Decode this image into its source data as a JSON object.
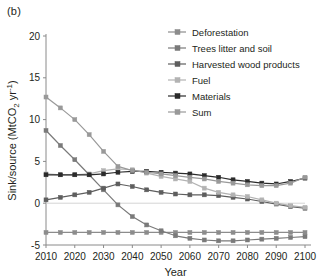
{
  "panel_label": "(b)",
  "axes": {
    "xlabel": "Year",
    "ylabel": "Sink/source (MtCO2 yr-1)",
    "ylabel_main": "Sink/source (MtCO",
    "ylabel_sub": "2",
    "ylabel_tail": " yr",
    "ylabel_sup": "-1",
    "ylabel_close": ")",
    "x_ticks": [
      "2010",
      "2020",
      "2030",
      "2040",
      "2050",
      "2060",
      "2070",
      "2080",
      "2090",
      "2100"
    ],
    "y_ticks": [
      "-5",
      "0",
      "5",
      "10",
      "15",
      "20"
    ]
  },
  "legend": {
    "position": "top-right",
    "items": [
      {
        "label": "Deforestation",
        "color": "#8c8c8c"
      },
      {
        "label": "Trees litter and soil",
        "color": "#7a7a7a"
      },
      {
        "label": "Harvested wood products",
        "color": "#5e5e5e"
      },
      {
        "label": "Fuel",
        "color": "#b3b3b3"
      },
      {
        "label": "Materials",
        "color": "#2b2b2b"
      },
      {
        "label": "Sum",
        "color": "#999999"
      }
    ]
  },
  "chart_data": {
    "type": "line",
    "title": "",
    "xlabel": "Year",
    "ylabel": "Sink/source (MtCO2 yr-1)",
    "x": [
      2010,
      2015,
      2020,
      2025,
      2030,
      2035,
      2040,
      2045,
      2050,
      2055,
      2060,
      2065,
      2070,
      2075,
      2080,
      2085,
      2090,
      2095,
      2100
    ],
    "xlim": [
      2010,
      2100
    ],
    "ylim": [
      -5,
      20
    ],
    "grid": false,
    "legend_position": "top-right",
    "series": [
      {
        "name": "Deforestation",
        "color": "#8c8c8c",
        "values": [
          -3.5,
          -3.5,
          -3.5,
          -3.5,
          -3.5,
          -3.5,
          -3.5,
          -3.5,
          -3.5,
          -3.5,
          -3.5,
          -3.5,
          -3.5,
          -3.5,
          -3.5,
          -3.5,
          -3.5,
          -3.5,
          -3.5
        ]
      },
      {
        "name": "Trees litter and soil",
        "color": "#7a7a7a",
        "values": [
          8.7,
          6.9,
          5.2,
          3.4,
          1.6,
          -0.2,
          -1.6,
          -2.6,
          -3.3,
          -3.9,
          -4.2,
          -4.4,
          -4.5,
          -4.5,
          -4.4,
          -4.3,
          -4.2,
          -4.1,
          -4.0
        ]
      },
      {
        "name": "Harvested wood products",
        "color": "#5e5e5e",
        "values": [
          0.4,
          0.7,
          1.0,
          1.3,
          1.8,
          2.3,
          2.0,
          1.6,
          1.3,
          1.1,
          1.0,
          1.0,
          0.9,
          0.7,
          0.5,
          0.2,
          -0.1,
          -0.4,
          -0.6
        ]
      },
      {
        "name": "Fuel",
        "color": "#b3b3b3",
        "values": [
          3.5,
          3.4,
          3.4,
          3.5,
          3.9,
          4.1,
          4.0,
          3.6,
          3.2,
          2.9,
          2.6,
          1.8,
          1.3,
          1.0,
          0.8,
          0.4,
          0.0,
          -0.3,
          -0.5
        ]
      },
      {
        "name": "Materials",
        "color": "#2b2b2b",
        "values": [
          3.4,
          3.4,
          3.4,
          3.4,
          3.5,
          3.7,
          3.8,
          3.8,
          3.7,
          3.6,
          3.5,
          3.3,
          3.1,
          2.8,
          2.6,
          2.4,
          2.3,
          2.6,
          3.0
        ]
      },
      {
        "name": "Sum",
        "color": "#999999",
        "values": [
          12.7,
          11.4,
          10.0,
          8.2,
          6.2,
          4.4,
          3.9,
          3.7,
          3.5,
          3.3,
          3.1,
          2.9,
          2.6,
          2.4,
          2.2,
          2.1,
          2.1,
          2.4,
          3.1
        ]
      }
    ]
  }
}
